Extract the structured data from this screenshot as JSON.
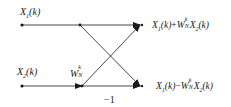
{
  "diagram": {
    "type": "butterfly-signal-flow-graph",
    "inputs": [
      {
        "var": "X",
        "sub": "1",
        "arg": "(k)"
      },
      {
        "var": "X",
        "sub": "2",
        "arg": "(k)"
      }
    ],
    "twiddle": {
      "var": "W",
      "sub": "N",
      "sup": "k"
    },
    "negation": "−1",
    "outputs": [
      {
        "a_var": "X",
        "a_sub": "1",
        "a_arg": "(k)",
        "op": "+",
        "w_var": "W",
        "w_sub": "N",
        "w_sup": "k",
        "b_var": "X",
        "b_sub": "2",
        "b_arg": "(k)"
      },
      {
        "a_var": "X",
        "a_sub": "1",
        "a_arg": "(k)",
        "op": "−",
        "w_var": "W",
        "w_sub": "N",
        "w_sup": "k",
        "b_var": "X",
        "b_sub": "2",
        "b_arg": "(k)"
      }
    ],
    "colors": {
      "line": "#1a1a1a",
      "background": "#ffffff"
    }
  }
}
